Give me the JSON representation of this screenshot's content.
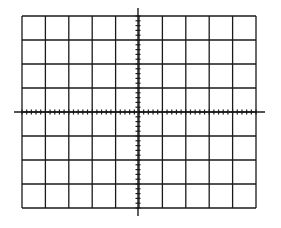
{
  "graticule": {
    "columns": 10,
    "rows": 8,
    "minor_ticks_per_division": 5,
    "bounds": {
      "left": 22,
      "top": 16,
      "right": 256,
      "bottom": 208
    },
    "center": {
      "x": 138,
      "y": 112
    },
    "horizontal_axis_extent": {
      "x1": 14,
      "x2": 265
    },
    "vertical_axis_extent": {
      "y1": 8,
      "y2": 216
    },
    "tick_half_length": 2.5,
    "line_color": "#1a1a1a",
    "background": "#ffffff"
  }
}
